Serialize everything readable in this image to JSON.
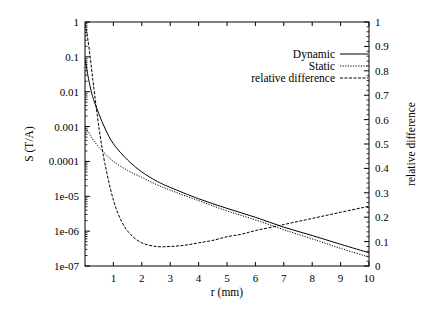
{
  "chart_data": {
    "type": "line",
    "title": "",
    "xlabel": "r (mm)",
    "ylabel": "S (T/A)",
    "y2label": "relative difference",
    "xlim": [
      0,
      10
    ],
    "ylim": [
      1e-07,
      1
    ],
    "yscale": "log",
    "y2lim": [
      0,
      1
    ],
    "y2scale": "linear",
    "grid": false,
    "legend_position": "upper right",
    "x_ticks": [
      "1",
      "2",
      "3",
      "4",
      "5",
      "6",
      "7",
      "8",
      "9",
      "10"
    ],
    "y_ticks": [
      "1",
      "0.1",
      "0.01",
      "0.001",
      "0.0001",
      "1e-05",
      "1e-06",
      "1e-07"
    ],
    "y2_ticks": [
      "1",
      "0.9",
      "0.8",
      "0.7",
      "0.6",
      "0.5",
      "0.4",
      "0.3",
      "0.2",
      "0.1",
      "0"
    ],
    "series": [
      {
        "name": "Dynamic",
        "axis": "left",
        "style": "solid",
        "x": [
          0.02,
          0.1,
          0.2,
          0.3,
          0.5,
          0.7,
          1.0,
          1.5,
          2.0,
          2.5,
          3.0,
          4.0,
          5.0,
          6.0,
          7.0,
          8.0,
          9.0,
          10.0
        ],
        "values": [
          0.08,
          0.03,
          0.012,
          0.006,
          0.0022,
          0.0009,
          0.00032,
          0.00011,
          5e-05,
          2.8e-05,
          1.8e-05,
          8.5e-06,
          4.5e-06,
          2.5e-06,
          1.3e-06,
          7.5e-07,
          4.2e-07,
          2.4e-07
        ]
      },
      {
        "name": "Static",
        "axis": "left",
        "style": "dotted",
        "x": [
          0.02,
          0.1,
          0.2,
          0.3,
          0.5,
          0.7,
          1.0,
          1.5,
          2.0,
          2.5,
          3.0,
          4.0,
          5.0,
          6.0,
          7.0,
          8.0,
          9.0,
          10.0
        ],
        "values": [
          0.0009,
          0.00075,
          0.00055,
          0.0004,
          0.00025,
          0.00017,
          0.0001,
          5.5e-05,
          3.5e-05,
          2.2e-05,
          1.5e-05,
          7.5e-06,
          3.8e-06,
          2.1e-06,
          1.1e-06,
          6e-07,
          3.2e-07,
          1.8e-07
        ]
      },
      {
        "name": "relative difference",
        "axis": "right",
        "style": "dashed",
        "x": [
          0.02,
          0.1,
          0.2,
          0.3,
          0.5,
          0.7,
          1.0,
          1.3,
          1.6,
          2.0,
          2.5,
          3.0,
          3.5,
          4.0,
          4.5,
          5.0,
          5.5,
          6.0,
          7.0,
          8.0,
          9.0,
          10.0
        ],
        "values": [
          0.99,
          0.93,
          0.84,
          0.74,
          0.56,
          0.42,
          0.27,
          0.18,
          0.13,
          0.095,
          0.08,
          0.08,
          0.085,
          0.095,
          0.105,
          0.12,
          0.13,
          0.145,
          0.17,
          0.195,
          0.22,
          0.245
        ]
      }
    ],
    "legend": [
      "Dynamic",
      "Static",
      "relative difference"
    ]
  }
}
